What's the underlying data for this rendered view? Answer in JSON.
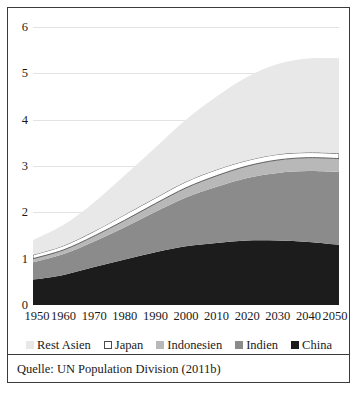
{
  "chart_data": {
    "type": "area",
    "title": "",
    "subtitle": "",
    "xlabel": "",
    "ylabel": "",
    "stacked": true,
    "grid": true,
    "legend_position": "bottom",
    "xlim": [
      1950,
      2050
    ],
    "ylim": [
      0,
      6
    ],
    "yticks": [
      "0",
      "1",
      "2",
      "3",
      "4",
      "5",
      "6"
    ],
    "ytick_values": [
      0,
      1,
      2,
      3,
      4,
      5,
      6
    ],
    "categories": [
      1950,
      1960,
      1970,
      1980,
      1990,
      2000,
      2010,
      2020,
      2030,
      2040,
      2050
    ],
    "xtick_labels": [
      "1950",
      "1960",
      "1970",
      "1980",
      "1990",
      "2000",
      "2010",
      "2020",
      "2030",
      "2040",
      "2050"
    ],
    "series": [
      {
        "name": "China",
        "color": "#1c1c1c",
        "values": [
          0.55,
          0.65,
          0.82,
          0.98,
          1.14,
          1.27,
          1.34,
          1.39,
          1.39,
          1.36,
          1.3
        ]
      },
      {
        "name": "Indien",
        "color": "#8b8b8b",
        "values": [
          0.37,
          0.45,
          0.55,
          0.7,
          0.87,
          1.05,
          1.21,
          1.35,
          1.46,
          1.53,
          1.57
        ]
      },
      {
        "name": "Indonesien",
        "color": "#b8b8b8",
        "values": [
          0.08,
          0.09,
          0.12,
          0.15,
          0.18,
          0.21,
          0.24,
          0.26,
          0.28,
          0.29,
          0.29
        ]
      },
      {
        "name": "Japan",
        "color": "#ffffff",
        "values": [
          0.08,
          0.09,
          0.1,
          0.12,
          0.12,
          0.13,
          0.13,
          0.12,
          0.12,
          0.11,
          0.11
        ]
      },
      {
        "name": "Rest Asien",
        "color": "#e8e8e8",
        "values": [
          0.32,
          0.45,
          0.63,
          0.85,
          1.09,
          1.34,
          1.58,
          1.8,
          1.95,
          2.03,
          2.06
        ]
      }
    ],
    "series_order_bottom_to_top": [
      "China",
      "Indien",
      "Indonesien",
      "Japan",
      "Rest Asien"
    ],
    "totals": [
      1.4,
      1.73,
      2.22,
      2.8,
      3.4,
      4.0,
      4.5,
      4.92,
      5.2,
      5.32,
      5.33
    ],
    "annotations": []
  },
  "legend": {
    "items": [
      {
        "label": "Rest Asien",
        "color": "#e8e8e8",
        "outlined": false
      },
      {
        "label": "Japan",
        "color": "#ffffff",
        "outlined": true
      },
      {
        "label": "Indonesien",
        "color": "#b8b8b8",
        "outlined": false
      },
      {
        "label": "Indien",
        "color": "#8b8b8b",
        "outlined": false
      },
      {
        "label": "China",
        "color": "#1c1c1c",
        "outlined": false
      }
    ]
  },
  "source": {
    "text": "Quelle: UN Population Division (2011b)"
  }
}
